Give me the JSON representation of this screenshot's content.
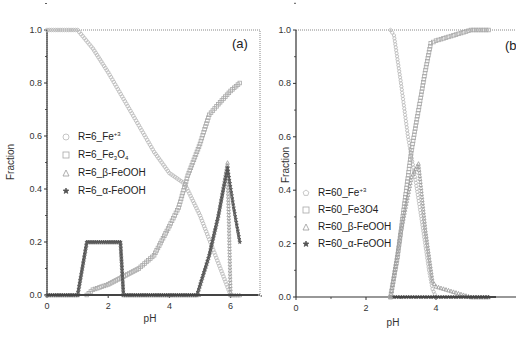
{
  "chart_data": [
    {
      "type": "scatter",
      "panel_label": "(a)",
      "xlabel": "pH",
      "ylabel": "Fraction",
      "xlim": [
        0,
        7
      ],
      "ylim": [
        0,
        1.0
      ],
      "xticks": [
        "0",
        "2",
        "4",
        "6"
      ],
      "yticks": [
        "0.0",
        "0.2",
        "0.4",
        "0.6",
        "0.8",
        "1.0"
      ],
      "legend_position": "center-left",
      "series": [
        {
          "name": "R=6_Fe+3",
          "label_main": "R=6_Fe",
          "label_sup": "+3",
          "marker": "circle",
          "x": [
            0,
            0.5,
            1.0,
            1.5,
            2.0,
            2.5,
            3.0,
            3.5,
            4.0,
            4.5,
            5.0,
            5.5,
            6.0
          ],
          "y": [
            1.0,
            1.0,
            1.0,
            0.93,
            0.84,
            0.74,
            0.64,
            0.54,
            0.46,
            0.42,
            0.3,
            0.15,
            0.0
          ]
        },
        {
          "name": "R=6_Fe3O4",
          "label_main": "R=6_Fe",
          "label_sub1": "3",
          "label_mid": "O",
          "label_sub2": "4",
          "marker": "square",
          "x": [
            1.3,
            1.5,
            2.0,
            2.5,
            3.0,
            3.5,
            4.0,
            4.3,
            4.6,
            5.0,
            5.3,
            5.6,
            6.0,
            6.3
          ],
          "y": [
            0.0,
            0.02,
            0.04,
            0.07,
            0.1,
            0.15,
            0.26,
            0.33,
            0.45,
            0.57,
            0.68,
            0.72,
            0.77,
            0.8
          ]
        },
        {
          "name": "R=6_β-FeOOH",
          "label_main": "R=6_β-FeOOH",
          "marker": "triangle",
          "x": [
            0,
            1.0,
            1.3,
            2.4,
            2.5,
            4.9,
            5.3,
            5.6,
            5.9,
            6.0,
            6.3
          ],
          "y": [
            0.0,
            0.0,
            0.2,
            0.2,
            0.0,
            0.0,
            0.15,
            0.3,
            0.5,
            0.0,
            0.0
          ]
        },
        {
          "name": "R=6_α-FeOOH",
          "label_main": "R=6_α-FeOOH",
          "marker": "star",
          "x": [
            0,
            1.0,
            1.3,
            2.4,
            2.5,
            4.9,
            5.3,
            5.6,
            5.9,
            6.1,
            6.3
          ],
          "y": [
            0.0,
            0.0,
            0.2,
            0.2,
            0.0,
            0.0,
            0.15,
            0.3,
            0.48,
            0.33,
            0.2
          ]
        }
      ]
    },
    {
      "type": "scatter",
      "panel_label": "(b",
      "xlabel": "pH",
      "ylabel": "Fraction",
      "xlim": [
        0,
        5.6
      ],
      "ylim": [
        0,
        1.0
      ],
      "xticks": [
        "0",
        "2",
        "4"
      ],
      "yticks": [
        "0.0",
        "0.2",
        "0.4",
        "0.6",
        "0.8",
        "1.0"
      ],
      "legend_position": "center-left",
      "series": [
        {
          "name": "R=60_Fe+3",
          "label_main": "R=60_Fe",
          "label_sup": "+3",
          "marker": "pentagon",
          "x": [
            2.7,
            2.8,
            3.0,
            3.2,
            3.4,
            3.6,
            3.8,
            3.9,
            4.0
          ],
          "y": [
            1.0,
            0.98,
            0.8,
            0.6,
            0.45,
            0.28,
            0.1,
            0.03,
            0.0
          ]
        },
        {
          "name": "R=60_Fe3O4",
          "label_main": "R=60_Fe3O4",
          "marker": "square",
          "x": [
            2.7,
            2.9,
            3.1,
            3.3,
            3.5,
            3.7,
            3.85,
            4.0,
            4.5,
            5.0,
            5.5
          ],
          "y": [
            0.0,
            0.15,
            0.35,
            0.55,
            0.7,
            0.85,
            0.95,
            0.96,
            0.98,
            1.0,
            1.0
          ]
        },
        {
          "name": "R=60_β-FeOOH",
          "label_main": "R=60_β-FeOOH",
          "marker": "triangle",
          "x": [
            2.7,
            3.0,
            3.3,
            3.5,
            3.7,
            3.9,
            4.0,
            4.5,
            5.0,
            5.5
          ],
          "y": [
            0.0,
            0.25,
            0.45,
            0.5,
            0.25,
            0.06,
            0.04,
            0.02,
            0.0,
            0.0
          ]
        },
        {
          "name": "R=60_α-FeOOH",
          "label_main": "R=60_α-FeOOH",
          "marker": "star",
          "x": [
            2.8,
            3.5,
            4.0,
            4.5,
            5.0,
            5.5
          ],
          "y": [
            0.0,
            0.0,
            0.0,
            0.0,
            0.0,
            0.0
          ]
        }
      ]
    }
  ],
  "colors": {
    "axis": "#333333",
    "circle_marker": "#b8b8b8",
    "square_marker": "#a8a8a8",
    "triangle_marker": "#9a9a9a",
    "star_marker": "#555555",
    "frame_dotted": "#888888"
  }
}
